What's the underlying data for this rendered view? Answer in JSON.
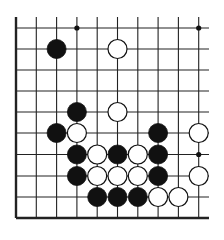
{
  "board": {
    "cols": 10,
    "rows": 10,
    "x_lines": [
      16,
      36.3,
      56.6,
      76.9,
      97.2,
      117.5,
      137.8,
      158.1,
      178.4,
      198.7
    ],
    "y_lines": [
      28,
      49,
      70,
      91,
      112,
      133,
      154.5,
      176,
      197,
      218
    ],
    "line_extent": {
      "top": 17,
      "right": 209
    },
    "edges": {
      "left": true,
      "bottom": true,
      "top": false,
      "right": false
    },
    "line_color": "#222222",
    "stone_radius": 9.5
  },
  "star_points": [
    {
      "col": 3,
      "row": 0
    },
    {
      "col": 9,
      "row": 0
    },
    {
      "col": 9,
      "row": 6
    }
  ],
  "stones": [
    {
      "color": "black",
      "col": 2,
      "row": 1
    },
    {
      "color": "white",
      "col": 5,
      "row": 1
    },
    {
      "color": "black",
      "col": 3,
      "row": 4
    },
    {
      "color": "white",
      "col": 5,
      "row": 4
    },
    {
      "color": "black",
      "col": 2,
      "row": 5
    },
    {
      "color": "white",
      "col": 3,
      "row": 5
    },
    {
      "color": "black",
      "col": 7,
      "row": 5
    },
    {
      "color": "white",
      "col": 9,
      "row": 5
    },
    {
      "color": "black",
      "col": 3,
      "row": 6
    },
    {
      "color": "white",
      "col": 4,
      "row": 6
    },
    {
      "color": "black",
      "col": 5,
      "row": 6
    },
    {
      "color": "white",
      "col": 6,
      "row": 6
    },
    {
      "color": "black",
      "col": 7,
      "row": 6
    },
    {
      "color": "black",
      "col": 3,
      "row": 7
    },
    {
      "color": "white",
      "col": 4,
      "row": 7
    },
    {
      "color": "white",
      "col": 5,
      "row": 7
    },
    {
      "color": "white",
      "col": 6,
      "row": 7
    },
    {
      "color": "black",
      "col": 7,
      "row": 7
    },
    {
      "color": "white",
      "col": 9,
      "row": 7
    },
    {
      "color": "black",
      "col": 4,
      "row": 8
    },
    {
      "color": "black",
      "col": 5,
      "row": 8
    },
    {
      "color": "black",
      "col": 6,
      "row": 8
    },
    {
      "color": "white",
      "col": 7,
      "row": 8
    },
    {
      "color": "white",
      "col": 8,
      "row": 8
    }
  ]
}
